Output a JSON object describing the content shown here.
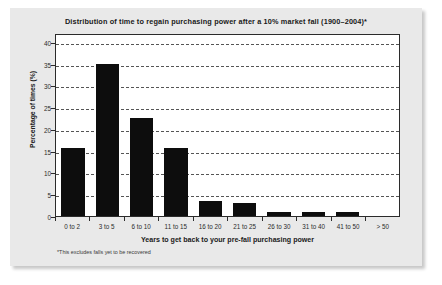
{
  "chart_data": {
    "type": "bar",
    "title": "Distribution of time to regain purchasing power after a 10% market fall (1900–2004)*",
    "xlabel": "Years to get back to your pre-fall purchasing power",
    "ylabel": "Percentage of times (%)",
    "categories": [
      "0 to 2",
      "3 to 5",
      "6 to 10",
      "11 to 15",
      "16 to 20",
      "21 to 25",
      "26 to 30",
      "31 to 40",
      "41 to 50",
      "> 50"
    ],
    "values": [
      15.5,
      35,
      22.5,
      15.5,
      3.5,
      3,
      1,
      1,
      1,
      0
    ],
    "ylim": [
      0,
      42
    ],
    "yticks": [
      0,
      5,
      10,
      15,
      20,
      25,
      30,
      35,
      40
    ],
    "grid": true,
    "legend": false,
    "footnote": "*This excludes falls yet to be recovered",
    "bar_color": "#0d0d0d",
    "panel_color": "#e9e9e9",
    "plot_bg_color": "#ffffff"
  }
}
